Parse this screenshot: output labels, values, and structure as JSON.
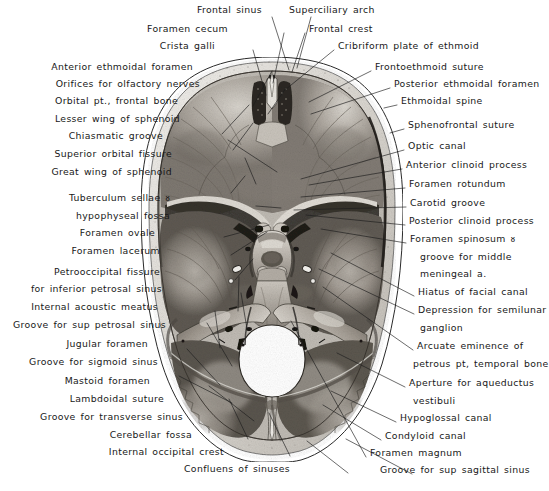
{
  "figure": {
    "type": "anatomical-photograph",
    "background_color": "#ffffff",
    "ink_color": "#181818"
  },
  "labels_top": [
    {
      "id": "frontal-sinus",
      "text": "Frontal  sinus",
      "align": "right",
      "x": 262,
      "y": 10,
      "tip_x": 278,
      "tip_y": 72
    },
    {
      "id": "superciliary-arch",
      "text": "Superciliary arch",
      "align": "left",
      "x": 289,
      "y": 10,
      "tip_x": 300,
      "tip_y": 70
    }
  ],
  "labels_left": [
    {
      "id": "foramen-cecum",
      "text": "Foramen cecum",
      "x": 228,
      "y": 29,
      "tip_x": 272,
      "tip_y": 86
    },
    {
      "id": "crista-galli",
      "text": "Crista galli",
      "x": 215,
      "y": 46,
      "tip_x": 265,
      "tip_y": 96
    },
    {
      "id": "anterior-ethmoidal-foramen",
      "text": "Anterior ethmoidal foramen",
      "x": 193,
      "y": 67,
      "tip_x": 250,
      "tip_y": 105
    },
    {
      "id": "orifices-olfactory-nerves",
      "text": "Orifices for olfactory nerves",
      "x": 200,
      "y": 84,
      "tip_x": 262,
      "tip_y": 112
    },
    {
      "id": "orbital-pt-frontal-bone",
      "text": "Orbital pt., frontal bone",
      "x": 178,
      "y": 101,
      "tip_x": 218,
      "tip_y": 132
    },
    {
      "id": "lesser-wing-of-sphenoid",
      "text": "Lesser wing of sphenoid",
      "x": 180,
      "y": 119,
      "tip_x": 230,
      "tip_y": 148
    },
    {
      "id": "chiasmatic-groove",
      "text": "Chiasmatic groove",
      "x": 163,
      "y": 136,
      "tip_x": 276,
      "tip_y": 171
    },
    {
      "id": "superior-orbital-fissure",
      "text": "Superior orbital fissure",
      "x": 172,
      "y": 154,
      "tip_x": 255,
      "tip_y": 183
    },
    {
      "id": "great-wing-of-sphenoid",
      "text": "Great wing of sphenoid",
      "x": 172,
      "y": 172,
      "tip_x": 228,
      "tip_y": 192
    },
    {
      "id": "tuberculum-sellae",
      "text": "Tuberculum  sellae ᴕ",
      "x": 170,
      "y": 198,
      "tip_x": 280,
      "tip_y": 207
    },
    {
      "id": "hypophyseal-fossa",
      "text": "hypophyseal fossa",
      "x": 170,
      "y": 216,
      "tip_x": 280,
      "tip_y": 207,
      "no_leader": true
    },
    {
      "id": "foramen-ovale",
      "text": "Foramen ovale",
      "x": 155,
      "y": 233,
      "tip_x": 268,
      "tip_y": 224
    },
    {
      "id": "foramen-lacerum",
      "text": "Foramen lacerum",
      "x": 160,
      "y": 251,
      "tip_x": 266,
      "tip_y": 231
    },
    {
      "id": "petrooccipital-fissure",
      "text": "Petrooccipital fissure",
      "x": 160,
      "y": 272,
      "tip_x": 252,
      "tip_y": 258
    },
    {
      "id": "for-inferior-petrosal-sinus",
      "text": "for inferior petrosal sinus",
      "x": 162,
      "y": 289,
      "tip_x": 252,
      "tip_y": 258,
      "no_leader": true
    },
    {
      "id": "internal-acoustic-meatus",
      "text": "Internal acoustic meatus",
      "x": 158,
      "y": 307,
      "tip_x": 238,
      "tip_y": 276
    },
    {
      "id": "groove-sup-petrosal-sinus",
      "text": "Groove  for  sup petrosal sinus",
      "x": 166,
      "y": 325,
      "tip_x": 240,
      "tip_y": 292
    },
    {
      "id": "jugular-foramen",
      "text": "Jugular  foramen",
      "x": 148,
      "y": 344,
      "tip_x": 214,
      "tip_y": 310
    },
    {
      "id": "groove-for-sigmoid-sinus",
      "text": "Groove for sigmoid sinus",
      "x": 158,
      "y": 362,
      "tip_x": 206,
      "tip_y": 322
    },
    {
      "id": "mastoid-foramen",
      "text": "Mastoid  foramen",
      "x": 150,
      "y": 381,
      "tip_x": 186,
      "tip_y": 348
    },
    {
      "id": "lambdoidal-suture",
      "text": "Lambdoidal suture",
      "x": 164,
      "y": 399,
      "tip_x": 178,
      "tip_y": 375
    },
    {
      "id": "groove-for-transverse-sinus",
      "text": "Groove for transverse sinus",
      "x": 183,
      "y": 417,
      "tip_x": 208,
      "tip_y": 385
    },
    {
      "id": "cerebellar-fossa",
      "text": "Cerebellar  fossa",
      "x": 192,
      "y": 435,
      "tip_x": 228,
      "tip_y": 398
    },
    {
      "id": "internal-occipital-crest",
      "text": "Internal  occipital  crest",
      "x": 224,
      "y": 452,
      "tip_x": 268,
      "tip_y": 412
    },
    {
      "id": "confluens-of-sinuses",
      "text": "Confluens of  sinuses",
      "x": 290,
      "y": 469,
      "tip_x": 306,
      "tip_y": 440
    }
  ],
  "labels_right": [
    {
      "id": "frontal-crest",
      "text": "Frontal  crest",
      "x": 309,
      "y": 29,
      "tip_x": 291,
      "tip_y": 74
    },
    {
      "id": "cribriform-plate-of-ethmoid",
      "text": "Cribriform plate of ethmoid",
      "x": 338,
      "y": 46,
      "tip_x": 284,
      "tip_y": 92
    },
    {
      "id": "frontoethmoid-suture",
      "text": "Frontoethmoid  suture",
      "x": 375,
      "y": 67,
      "tip_x": 308,
      "tip_y": 104
    },
    {
      "id": "posterior-ethmoidal-foramen",
      "text": "Posterior ethmoidal foramen",
      "x": 394,
      "y": 84,
      "tip_x": 310,
      "tip_y": 116
    },
    {
      "id": "ethmoidal-spine",
      "text": "Ethmoidal  spine",
      "x": 401,
      "y": 101,
      "tip_x": 383,
      "tip_y": 107
    },
    {
      "id": "sphenofrontal-suture",
      "text": "Sphenofrontal suture",
      "x": 408,
      "y": 125,
      "tip_x": 389,
      "tip_y": 132
    },
    {
      "id": "optic-canal",
      "text": "Optic  canal",
      "x": 408,
      "y": 146,
      "tip_x": 300,
      "tip_y": 178
    },
    {
      "id": "anterior-clinoid-process",
      "text": "Anterior clinoid  process",
      "x": 406,
      "y": 165,
      "tip_x": 308,
      "tip_y": 184
    },
    {
      "id": "foramen-rotundum",
      "text": "Foramen  rotundum",
      "x": 409,
      "y": 184,
      "tip_x": 300,
      "tip_y": 196
    },
    {
      "id": "carotid-groove",
      "text": "Carotid  groove",
      "x": 410,
      "y": 203,
      "tip_x": 293,
      "tip_y": 209
    },
    {
      "id": "posterior-clinoid-process",
      "text": "Posterior  clinoid process",
      "x": 409,
      "y": 221,
      "tip_x": 305,
      "tip_y": 214
    },
    {
      "id": "foramen-spinosum",
      "text": "Foramen spinosum ᴕ",
      "x": 410,
      "y": 239,
      "tip_x": 320,
      "tip_y": 228
    },
    {
      "id": "groove-for-middle",
      "text": "groove for middle",
      "x": 420,
      "y": 257,
      "tip_x": 320,
      "tip_y": 228,
      "no_leader": true
    },
    {
      "id": "meningeal-a",
      "text": "meningeal a.",
      "x": 420,
      "y": 274,
      "tip_x": 320,
      "tip_y": 228,
      "no_leader": true
    },
    {
      "id": "hiatus-of-facial-canal",
      "text": "Hiatus of facial canal",
      "x": 418,
      "y": 292,
      "tip_x": 330,
      "tip_y": 252
    },
    {
      "id": "depression-for-semilunar",
      "text": "Depression for semilunar",
      "x": 418,
      "y": 310,
      "tip_x": 318,
      "tip_y": 268
    },
    {
      "id": "ganglion",
      "text": "ganglion",
      "x": 420,
      "y": 328,
      "tip_x": 318,
      "tip_y": 268,
      "no_leader": true
    },
    {
      "id": "arcuate-eminence-of",
      "text": "Arcuate  eminence  of",
      "x": 417,
      "y": 346,
      "tip_x": 322,
      "tip_y": 286
    },
    {
      "id": "petrous-pt-temporal-bone",
      "text": "petrous pt, temporal bone",
      "x": 413,
      "y": 364,
      "tip_x": 322,
      "tip_y": 286,
      "no_leader": true
    },
    {
      "id": "aperture-for-aqueductus",
      "text": "Aperture for aqueductus",
      "x": 409,
      "y": 383,
      "tip_x": 336,
      "tip_y": 352
    },
    {
      "id": "vestibuli",
      "text": "vestibuli",
      "x": 413,
      "y": 401,
      "tip_x": 336,
      "tip_y": 352,
      "no_leader": true
    },
    {
      "id": "hypoglossal-canal",
      "text": "Hypoglossal canal",
      "x": 400,
      "y": 418,
      "tip_x": 330,
      "tip_y": 390
    },
    {
      "id": "condyloid-canal",
      "text": "Condyloid  canal",
      "x": 385,
      "y": 436,
      "tip_x": 322,
      "tip_y": 404
    },
    {
      "id": "foramen-magnum",
      "text": "Foramen magnum",
      "x": 370,
      "y": 453,
      "tip_x": 290,
      "tip_y": 320
    },
    {
      "id": "groove-for-sup-sagittal-sinus",
      "text": "Groove for sup sagittal  sinus",
      "x": 380,
      "y": 470,
      "tip_x": 345,
      "tip_y": 438
    }
  ]
}
